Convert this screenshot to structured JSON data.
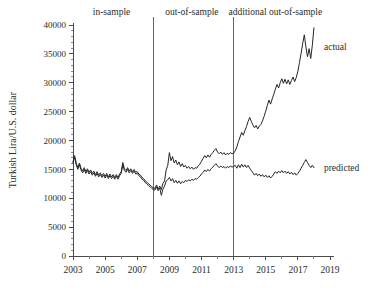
{
  "chart_data": {
    "type": "line",
    "title": "",
    "xlabel": "",
    "ylabel": "Turkish Lira/U.S. dollar",
    "xlim": [
      2003,
      2019
    ],
    "ylim": [
      0,
      40000
    ],
    "grid": false,
    "legend_position": "right-inline",
    "y_ticks": [
      0,
      5000,
      10000,
      15000,
      20000,
      25000,
      30000,
      35000,
      40000
    ],
    "y_tick_labels": [
      "0",
      "5000",
      "10000",
      "15000",
      "20000",
      "25000",
      "30000",
      "35000",
      "40000"
    ],
    "y_minor_step": 1000,
    "x_ticks": [
      2003,
      2005,
      2007,
      2009,
      2011,
      2013,
      2015,
      2017,
      2019
    ],
    "x_tick_labels": [
      "2003",
      "2005",
      "2007",
      "2009",
      "2011",
      "2013",
      "2015",
      "2017",
      "2019"
    ],
    "x_minor_ticks": [
      2004,
      2006,
      2008,
      2010,
      2012,
      2014,
      2016,
      2018
    ],
    "annotations": [
      {
        "name": "in-sample",
        "label": "in-sample",
        "x_center": 2005.4,
        "region_start": 2003.0,
        "region_end": 2008.0
      },
      {
        "name": "out-of-sample",
        "label": "out-of-sample",
        "x_center": 2010.4,
        "region_start": 2008.0,
        "region_end": 2013.0
      },
      {
        "name": "additional-out-of-sample",
        "label": "additional out-of-sample",
        "x_center": 2015.6,
        "region_start": 2013.0,
        "region_end": 2019.0
      }
    ],
    "dividers": [
      {
        "name": "in-sample-end",
        "x": 2008.0
      },
      {
        "name": "out-of-sample-end",
        "x": 2013.0
      }
    ],
    "series": [
      {
        "name": "actual",
        "label": "actual",
        "color": "#262626",
        "label_x": 2018.25,
        "label_y": 36200,
        "x": [
          2003.0,
          2003.1,
          2003.2,
          2003.3,
          2003.4,
          2003.5,
          2003.6,
          2003.7,
          2003.8,
          2003.9,
          2004.0,
          2004.1,
          2004.2,
          2004.3,
          2004.4,
          2004.5,
          2004.6,
          2004.7,
          2004.8,
          2004.9,
          2005.0,
          2005.1,
          2005.2,
          2005.3,
          2005.4,
          2005.5,
          2005.6,
          2005.7,
          2005.8,
          2005.9,
          2006.0,
          2006.1,
          2006.2,
          2006.3,
          2006.4,
          2006.5,
          2006.6,
          2006.7,
          2006.8,
          2006.9,
          2007.0,
          2007.1,
          2007.2,
          2007.3,
          2007.4,
          2007.5,
          2007.6,
          2007.7,
          2007.8,
          2007.9,
          2008.0,
          2008.1,
          2008.2,
          2008.3,
          2008.4,
          2008.5,
          2008.6,
          2008.7,
          2008.8,
          2008.9,
          2009.0,
          2009.1,
          2009.2,
          2009.3,
          2009.4,
          2009.5,
          2009.6,
          2009.7,
          2009.8,
          2009.9,
          2010.0,
          2010.1,
          2010.2,
          2010.3,
          2010.4,
          2010.5,
          2010.6,
          2010.7,
          2010.8,
          2010.9,
          2011.0,
          2011.1,
          2011.2,
          2011.3,
          2011.4,
          2011.5,
          2011.6,
          2011.7,
          2011.8,
          2011.9,
          2012.0,
          2012.1,
          2012.2,
          2012.3,
          2012.4,
          2012.5,
          2012.6,
          2012.7,
          2012.8,
          2012.9,
          2013.0,
          2013.1,
          2013.2,
          2013.3,
          2013.4,
          2013.5,
          2013.6,
          2013.7,
          2013.8,
          2013.9,
          2014.0,
          2014.1,
          2014.2,
          2014.3,
          2014.4,
          2014.5,
          2014.6,
          2014.7,
          2014.8,
          2014.9,
          2015.0,
          2015.1,
          2015.2,
          2015.3,
          2015.4,
          2015.5,
          2015.6,
          2015.7,
          2015.8,
          2015.9,
          2016.0,
          2016.1,
          2016.2,
          2016.3,
          2016.4,
          2016.5,
          2016.6,
          2016.7,
          2016.8,
          2016.9,
          2017.0,
          2017.1,
          2017.2,
          2017.3,
          2017.4,
          2017.5,
          2017.6,
          2017.7,
          2017.8,
          2017.9,
          2018.0
        ],
        "y": [
          16300,
          17400,
          16100,
          15300,
          16100,
          15200,
          14700,
          15300,
          14600,
          15100,
          14500,
          14900,
          14300,
          14700,
          14100,
          14600,
          14000,
          14400,
          13900,
          14300,
          13800,
          14300,
          13700,
          14200,
          13700,
          14100,
          13600,
          14100,
          13600,
          14200,
          14600,
          16200,
          15100,
          14800,
          15300,
          14700,
          15100,
          14600,
          15000,
          14500,
          14600,
          14200,
          14000,
          13600,
          13400,
          13000,
          12800,
          12500,
          12300,
          12000,
          11800,
          11700,
          12300,
          11600,
          12100,
          11500,
          12600,
          13000,
          14900,
          15700,
          17900,
          16500,
          17200,
          16100,
          16600,
          15800,
          16300,
          15500,
          16000,
          15400,
          15700,
          15200,
          15500,
          15100,
          15400,
          15000,
          15300,
          15200,
          15600,
          15900,
          16400,
          16900,
          17400,
          17000,
          17500,
          17100,
          17600,
          17900,
          18300,
          18600,
          18000,
          17700,
          18000,
          17600,
          17900,
          17500,
          17800,
          17600,
          17900,
          17700,
          17800,
          18200,
          18900,
          19800,
          20600,
          21400,
          20900,
          21700,
          22400,
          23300,
          24000,
          23300,
          22700,
          22200,
          22600,
          22000,
          22500,
          22800,
          23400,
          24200,
          25100,
          26100,
          27000,
          26300,
          27200,
          28000,
          28900,
          29700,
          29100,
          30000,
          30700,
          29900,
          30600,
          29800,
          30500,
          29700,
          30400,
          31000,
          30200,
          30900,
          32000,
          33500,
          35100,
          36800,
          38300,
          36200,
          34500,
          35900,
          34200,
          36500,
          39500
        ],
        "y_min": 11600,
        "y_max": 39500
      },
      {
        "name": "predicted",
        "label": "predicted",
        "color": "#262626",
        "label_x": 2018.25,
        "label_y": 15200,
        "x": [
          2003.0,
          2003.1,
          2003.2,
          2003.3,
          2003.4,
          2003.5,
          2003.6,
          2003.7,
          2003.8,
          2003.9,
          2004.0,
          2004.1,
          2004.2,
          2004.3,
          2004.4,
          2004.5,
          2004.6,
          2004.7,
          2004.8,
          2004.9,
          2005.0,
          2005.1,
          2005.2,
          2005.3,
          2005.4,
          2005.5,
          2005.6,
          2005.7,
          2005.8,
          2005.9,
          2006.0,
          2006.1,
          2006.2,
          2006.3,
          2006.4,
          2006.5,
          2006.6,
          2006.7,
          2006.8,
          2006.9,
          2007.0,
          2007.1,
          2007.2,
          2007.3,
          2007.4,
          2007.5,
          2007.6,
          2007.7,
          2007.8,
          2007.9,
          2008.0,
          2008.1,
          2008.2,
          2008.3,
          2008.4,
          2008.5,
          2008.6,
          2008.7,
          2008.8,
          2008.9,
          2009.0,
          2009.1,
          2009.2,
          2009.3,
          2009.4,
          2009.5,
          2009.6,
          2009.7,
          2009.8,
          2009.9,
          2010.0,
          2010.1,
          2010.2,
          2010.3,
          2010.4,
          2010.5,
          2010.6,
          2010.7,
          2010.8,
          2010.9,
          2011.0,
          2011.1,
          2011.2,
          2011.3,
          2011.4,
          2011.5,
          2011.6,
          2011.7,
          2011.8,
          2011.9,
          2012.0,
          2012.1,
          2012.2,
          2012.3,
          2012.4,
          2012.5,
          2012.6,
          2012.7,
          2012.8,
          2012.9,
          2013.0,
          2013.1,
          2013.2,
          2013.3,
          2013.4,
          2013.5,
          2013.6,
          2013.7,
          2013.8,
          2013.9,
          2014.0,
          2014.1,
          2014.2,
          2014.3,
          2014.4,
          2014.5,
          2014.6,
          2014.7,
          2014.8,
          2014.9,
          2015.0,
          2015.1,
          2015.2,
          2015.3,
          2015.4,
          2015.5,
          2015.6,
          2015.7,
          2015.8,
          2015.9,
          2016.0,
          2016.1,
          2016.2,
          2016.3,
          2016.4,
          2016.5,
          2016.6,
          2016.7,
          2016.8,
          2016.9,
          2017.0,
          2017.1,
          2017.2,
          2017.3,
          2017.4,
          2017.5,
          2017.6,
          2017.7,
          2017.8,
          2017.9,
          2018.0
        ],
        "y": [
          16100,
          17100,
          15800,
          15000,
          15800,
          14900,
          14400,
          15000,
          14300,
          14800,
          14200,
          14600,
          14000,
          14400,
          13800,
          14300,
          13700,
          14100,
          13600,
          14000,
          13500,
          14000,
          13400,
          13900,
          13400,
          13800,
          13300,
          13800,
          13300,
          13900,
          14300,
          15800,
          14800,
          14500,
          15000,
          14400,
          14800,
          14300,
          14700,
          14200,
          14300,
          13900,
          13700,
          13300,
          13100,
          12700,
          12500,
          12200,
          12000,
          11700,
          11500,
          11400,
          12000,
          11300,
          11800,
          10500,
          11600,
          12100,
          13000,
          13200,
          13600,
          13000,
          13400,
          12700,
          13100,
          12600,
          13000,
          12500,
          12900,
          12700,
          13100,
          12900,
          13200,
          13000,
          13300,
          13100,
          13400,
          13300,
          13600,
          13800,
          14200,
          14500,
          14900,
          14600,
          15000,
          14700,
          15100,
          15400,
          15700,
          16000,
          15600,
          15300,
          15600,
          15300,
          15500,
          15200,
          15500,
          15300,
          15600,
          15400,
          15500,
          15700,
          15200,
          15800,
          15300,
          15900,
          15400,
          15800,
          15300,
          15700,
          15200,
          14800,
          14400,
          14000,
          14300,
          13900,
          14200,
          13800,
          14100,
          13700,
          14000,
          13600,
          13900,
          13500,
          13800,
          14200,
          14600,
          14300,
          14700,
          14400,
          14800,
          14400,
          14700,
          14300,
          14600,
          14200,
          14500,
          14100,
          14400,
          14000,
          14300,
          14700,
          15200,
          15700,
          16200,
          16700,
          16200,
          15700,
          15300,
          15700,
          15300
        ],
        "y_min": 10500,
        "y_max": 17100
      }
    ]
  }
}
